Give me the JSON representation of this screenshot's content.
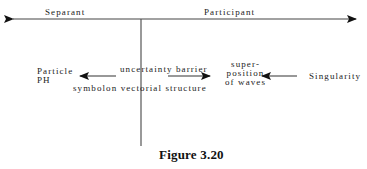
{
  "diagram": {
    "axis": {
      "left_label": "Separant",
      "right_label": "Participant"
    },
    "nodes": {
      "particle": [
        "Particle",
        "PH"
      ],
      "barrier": "uncertainty barrier",
      "symbolon": "symbolon vectorial structure",
      "superposition": [
        "super-",
        "position",
        "of waves"
      ],
      "singularity": "Singularity"
    },
    "arrows": [
      {
        "from": "uncertainty barrier",
        "to": "Particle PH"
      },
      {
        "from": "uncertainty barrier",
        "to": "superposition of waves"
      },
      {
        "from": "Singularity",
        "to": "superposition of waves"
      }
    ],
    "colors": {
      "line": "#333333",
      "text": "#222222"
    }
  },
  "caption": "Figure 3.20"
}
